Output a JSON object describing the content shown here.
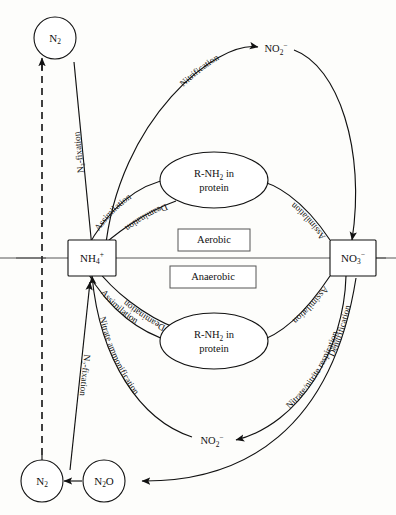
{
  "diagram": {
    "background_color": "#fdfdfb",
    "line_color": "#111111"
  },
  "zones": {
    "aerobic": "Aerobic",
    "anaerobic": "Anaerobic"
  },
  "nodes": {
    "n2_top": {
      "label": "N",
      "sub": "2",
      "shape": "circle"
    },
    "n2_bottom": {
      "label": "N",
      "sub": "2",
      "shape": "circle"
    },
    "n2o": {
      "label": "N",
      "sub": "2",
      "label2": "O",
      "shape": "circle"
    },
    "nh4": {
      "label": "NH",
      "sub": "4",
      "sup": "+",
      "shape": "box"
    },
    "no3": {
      "label": "NO",
      "sub": "3",
      "sup": "−",
      "shape": "box"
    },
    "no2_top": {
      "label": "NO",
      "sub": "2",
      "sup": "−",
      "shape": "plain"
    },
    "no2_bottom": {
      "label": "NO",
      "sub": "2",
      "sup": "−",
      "shape": "plain"
    },
    "protein_top": {
      "line1": "R-NH",
      "sub": "2",
      "line1b": " in",
      "line2": "protein",
      "shape": "ellipse"
    },
    "protein_bottom": {
      "line1": "R-NH",
      "sub": "2",
      "line1b": " in",
      "line2": "protein",
      "shape": "ellipse"
    }
  },
  "edge_labels": {
    "nitrification": "Nitrification",
    "n2_fixation_top": "N₂-fixation",
    "n2_fixation_bottom": "N₂-fixation",
    "assimilation_top_left": "Assimilation",
    "deamination_top_left": "Deamination",
    "assimilation_top_right": "Assimilation",
    "deamination_bottom_left": "Deamination",
    "assimilation_bottom_left": "Assimilation",
    "assimilation_bottom_right": "Assimilation",
    "nitrate_ammonification": "Nitrate ammonification",
    "nitrate_nitrite_respiration": "Nitrate/nitrite respiration",
    "denitrification": "Denitrification"
  }
}
